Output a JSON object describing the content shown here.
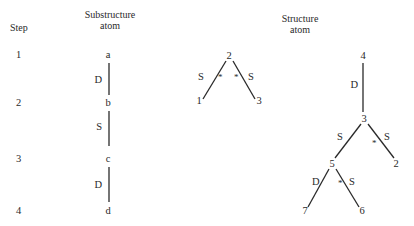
{
  "headers": {
    "step": "Step",
    "substructure_line1": "Substructure",
    "substructure_line2": "atom",
    "structure_line1": "Structure",
    "structure_line2": "atom"
  },
  "steps": [
    "1",
    "2",
    "3",
    "4"
  ],
  "substructure": {
    "atoms": [
      "a",
      "b",
      "c",
      "d"
    ],
    "bonds": [
      {
        "from": "a",
        "to": "b",
        "type": "D"
      },
      {
        "from": "b",
        "to": "c",
        "type": "S"
      },
      {
        "from": "c",
        "to": "d",
        "type": "D"
      }
    ]
  },
  "middle_tree": {
    "nodes": [
      "2",
      "1",
      "3"
    ],
    "bonds": [
      {
        "from": "2",
        "to": "1",
        "type": "S",
        "mark": "*"
      },
      {
        "from": "2",
        "to": "3",
        "type": "S",
        "mark": "*"
      }
    ]
  },
  "structure_tree": {
    "nodes": [
      "4",
      "3",
      "2",
      "5",
      "7",
      "6"
    ],
    "bonds": [
      {
        "from": "4",
        "to": "3",
        "type": "D",
        "mark": ""
      },
      {
        "from": "3",
        "to": "5",
        "type": "S",
        "mark": ""
      },
      {
        "from": "3",
        "to": "2",
        "type": "S",
        "mark": "*"
      },
      {
        "from": "5",
        "to": "7",
        "type": "D",
        "mark": ""
      },
      {
        "from": "5",
        "to": "6",
        "type": "S",
        "mark": "*"
      }
    ]
  }
}
